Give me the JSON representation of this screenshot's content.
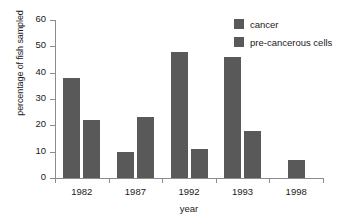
{
  "chart_data": {
    "type": "bar",
    "title": "",
    "xlabel": "year",
    "ylabel": "percentage of fish sampled",
    "categories": [
      "1982",
      "1987",
      "1992",
      "1993",
      "1998"
    ],
    "series": [
      {
        "name": "cancer",
        "values": [
          38,
          10,
          48,
          46,
          7
        ],
        "color": "#595959"
      },
      {
        "name": "pre-cancerous cells",
        "values": [
          22,
          23,
          11,
          18,
          null
        ],
        "color": "#595959"
      }
    ],
    "ylim": [
      0,
      60
    ],
    "yticks": [
      0,
      10,
      20,
      30,
      40,
      50,
      60
    ],
    "ytick_labels": [
      "0",
      "10",
      "20",
      "30",
      "40",
      "50",
      "60"
    ],
    "grid": false,
    "legend_position": "top-right"
  },
  "legend": {
    "items": [
      {
        "label": "cancer"
      },
      {
        "label": "pre-cancerous cells"
      }
    ]
  },
  "axes": {
    "y_title": "percentage of fish sampled",
    "x_title": "year"
  },
  "colors": {
    "bar": "#595959",
    "axis": "#8c8c8c",
    "text": "#1a1a1a",
    "background": "#ffffff"
  }
}
